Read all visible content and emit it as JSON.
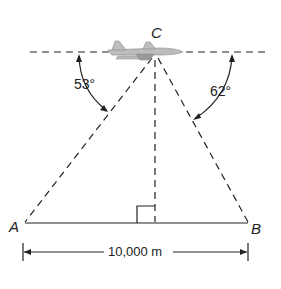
{
  "diagram": {
    "points": {
      "C": "C",
      "A": "A",
      "B": "B"
    },
    "angles": {
      "left": "53°",
      "right": "62°"
    },
    "distance": "10,000 m",
    "colors": {
      "ink": "#222222",
      "background": "#ffffff"
    }
  }
}
